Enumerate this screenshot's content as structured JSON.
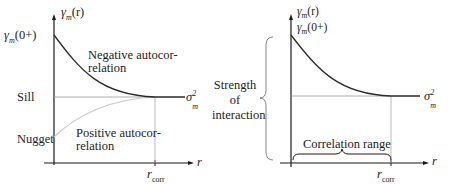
{
  "left_panel": {
    "y_axis_label": "γm(r)",
    "y_axis_symbol": "γ",
    "y_axis_sub": "m",
    "y_axis_arg": "(r)",
    "gamma0_symbol": "γ",
    "gamma0_sub": "m",
    "gamma0_arg": "(0+)",
    "sill_label": "Sill",
    "nugget_label": "Nugget",
    "negative_label_line1": "Negative autocor-",
    "negative_label_line2": "relation",
    "positive_label_line1": "Positive autocor-",
    "positive_label_line2": "relation",
    "sigma_symbol": "σ",
    "sigma_sub": "m",
    "sigma_sup": "2",
    "x_axis_label": "r",
    "rcorr_symbol": "r",
    "rcorr_sub": "corr"
  },
  "right_panel": {
    "y_axis_symbol": "γ",
    "y_axis_sub": "m",
    "y_axis_arg": "(r)",
    "gamma0_symbol": "γ",
    "gamma0_sub": "m",
    "gamma0_arg": "(0+)",
    "strength_line1": "Strength",
    "strength_line2": "of",
    "strength_line3": "interaction",
    "correlation_range_label": "Correlation range",
    "sigma_symbol": "σ",
    "sigma_sub": "m",
    "sigma_sup": "2",
    "x_axis_label": "r",
    "rcorr_symbol": "r",
    "rcorr_sub": "corr"
  },
  "colors": {
    "axis": "#1a1a1a",
    "curve": "#2a2a2a",
    "sill_line": "#9a9a9a",
    "positive_curve": "#c8c8c8",
    "brace": "#777777"
  }
}
